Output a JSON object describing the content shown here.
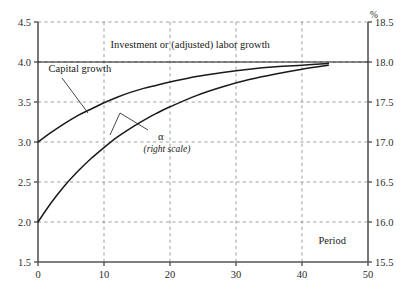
{
  "chart_data": {
    "type": "line",
    "title": "",
    "xlabel": "Period",
    "ylabel": "",
    "y2label": "%",
    "grid": true,
    "legend": "inline-annotations",
    "xlim": [
      0,
      50
    ],
    "ylim": [
      1.5,
      4.5
    ],
    "y2lim": [
      15.5,
      18.5
    ],
    "xticks": [
      "0",
      "10",
      "20",
      "30",
      "40",
      "50"
    ],
    "xtick_values": [
      0,
      10,
      20,
      30,
      40,
      50
    ],
    "yticks": [
      "1.5",
      "2.0",
      "2.5",
      "3.0",
      "3.5",
      "4.0",
      "4.5"
    ],
    "ytick_values": [
      1.5,
      2.0,
      2.5,
      3.0,
      3.5,
      4.0,
      4.5
    ],
    "y2ticks": [
      "15.5",
      "16.0",
      "16.5",
      "17.0",
      "17.5",
      "18.0",
      "18.5"
    ],
    "y2tick_values": [
      15.5,
      16.0,
      16.5,
      17.0,
      17.5,
      18.0,
      18.5
    ],
    "series": [
      {
        "name": "Investment or (adjusted) labor growth",
        "axis": "left",
        "style": "horizontal-line",
        "x": [
          0,
          50
        ],
        "values": [
          4.0,
          4.0
        ]
      },
      {
        "name": "Capital growth",
        "axis": "left",
        "style": "curve",
        "x": [
          0,
          2,
          4,
          6,
          8,
          10,
          12,
          14,
          16,
          18,
          20,
          24,
          28,
          32,
          36,
          40,
          44
        ],
        "values": [
          3.0,
          3.12,
          3.23,
          3.33,
          3.41,
          3.49,
          3.56,
          3.62,
          3.67,
          3.71,
          3.75,
          3.82,
          3.87,
          3.91,
          3.94,
          3.96,
          3.98
        ]
      },
      {
        "name": "α",
        "axis": "right",
        "style": "curve",
        "x": [
          0,
          2,
          4,
          6,
          8,
          10,
          12,
          14,
          16,
          18,
          20,
          24,
          28,
          32,
          36,
          40,
          44
        ],
        "values": [
          2.0,
          2.24,
          2.45,
          2.63,
          2.79,
          2.93,
          3.06,
          3.17,
          3.27,
          3.36,
          3.44,
          3.58,
          3.69,
          3.78,
          3.85,
          3.91,
          3.96
        ]
      }
    ],
    "annotations": [
      {
        "id": "investment-label",
        "text": "Investment or (adjusted) labor growth",
        "x": 11.0,
        "y": 4.17
      },
      {
        "id": "capital-growth-label",
        "text": "Capital growth",
        "x": 1.6,
        "y": 3.87
      },
      {
        "id": "alpha-label",
        "text": "α",
        "x": 18.2,
        "y": 3.02
      },
      {
        "id": "alpha-right-scale-label",
        "text": "(right scale)",
        "x": 16.0,
        "y": 2.88
      },
      {
        "id": "period-label",
        "text": "Period",
        "x": 42.5,
        "y": 1.73
      }
    ],
    "colors": {
      "curve": "#1a1a1a",
      "axis": "#555555",
      "grid": "#777777",
      "background": "#ffffff",
      "text": "#1a1a1a"
    }
  }
}
